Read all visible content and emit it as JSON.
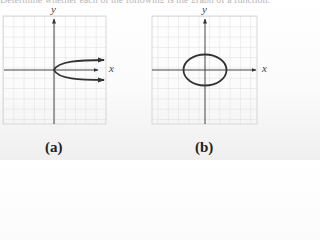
{
  "top_text": "Determine whether each of the following is the graph of a function.",
  "graphs": [
    {
      "label": "(a)",
      "x_axis_label": "x",
      "y_axis_label": "y",
      "curve": "sideways parabola opening right, vertex at origin, with arrows"
    },
    {
      "label": "(b)",
      "x_axis_label": "x",
      "y_axis_label": "y",
      "curve": "ellipse centered at origin"
    }
  ],
  "colors": {
    "grid": "#d6d6d6",
    "axis": "#444444",
    "curve": "#333333"
  }
}
